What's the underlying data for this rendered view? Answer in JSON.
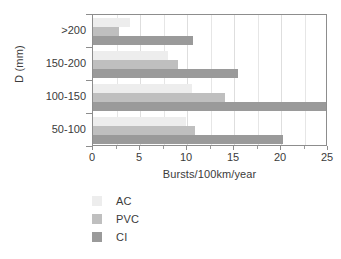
{
  "chart_data": {
    "type": "bar",
    "orientation": "horizontal",
    "title": "",
    "xlabel": "Bursts/100km/year",
    "ylabel": "D (mm)",
    "categories": [
      "50-100",
      "100-150",
      "150-200",
      ">200"
    ],
    "categories_display_order": [
      ">200",
      "150-200",
      "100-150",
      "50-100"
    ],
    "series": [
      {
        "name": "AC",
        "color": "#ededed",
        "values": [
          9.9,
          10.5,
          8.0,
          3.9
        ]
      },
      {
        "name": "PVC",
        "color": "#bfbfbf",
        "values": [
          10.8,
          14.0,
          9.0,
          2.8
        ]
      },
      {
        "name": "CI",
        "color": "#9a9a9a",
        "values": [
          20.2,
          24.8,
          15.4,
          10.6
        ]
      }
    ],
    "xlim": [
      0,
      25
    ],
    "xticks": [
      0,
      5,
      10,
      15,
      20,
      25
    ],
    "xtick_labels": [
      "0",
      "5",
      "10",
      "15",
      "20",
      "25"
    ],
    "xticks_minor": [
      2.5,
      7.5,
      12.5,
      17.5,
      22.5
    ],
    "grid": true,
    "grid_axis": "x",
    "legend_position": "below-left",
    "legend_entries": [
      "AC",
      "PVC",
      "CI"
    ]
  },
  "axes": {
    "y_title": "D (mm)",
    "x_title": "Bursts/100km/year"
  },
  "colors": {
    "frame": "#8d8d8d",
    "grid": "#e6e6e6",
    "text": "#3b3b3b",
    "background": "#ffffff",
    "ac": "#ededed",
    "pvc": "#bfbfbf",
    "ci": "#9a9a9a"
  }
}
